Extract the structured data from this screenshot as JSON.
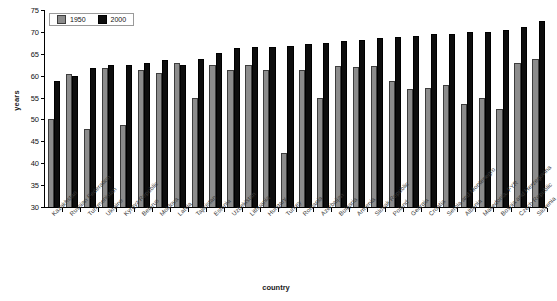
{
  "chart_data": {
    "type": "bar",
    "title": "",
    "xlabel": "country",
    "ylabel": "years",
    "ylim": [
      30,
      75
    ],
    "yticks": [
      30,
      35,
      40,
      45,
      50,
      55,
      60,
      65,
      70,
      75
    ],
    "grid": false,
    "legend_position": "top-left",
    "categories": [
      "Kazakhstan",
      "Russian Federation",
      "Turkmenistan",
      "Ukraine",
      "Kyrgyz Republic",
      "Belarus",
      "Moldova",
      "Latvia",
      "Tajikistan",
      "Estonia",
      "Uzbekistan",
      "Lithuania",
      "Hungary",
      "Turkey",
      "Romania",
      "Azerbaijan",
      "Bulgaria",
      "Armenia",
      "Slovak Republic",
      "Poland",
      "Georgia",
      "Croatia",
      "Serbia and Montenegro",
      "Albania",
      "Macedonia, FYR",
      "Bosnia and Herzegovina",
      "Czech Republic",
      "Slovenia"
    ],
    "series": [
      {
        "name": "1950",
        "color": "#8c8c8c",
        "values": [
          50.0,
          60.3,
          47.8,
          61.8,
          48.8,
          61.3,
          60.5,
          62.8,
          54.8,
          62.5,
          61.2,
          62.5,
          61.3,
          42.3,
          61.2,
          54.8,
          62.3,
          62.0,
          62.3,
          58.8,
          57.0,
          57.2,
          57.8,
          53.5,
          54.8,
          52.5,
          63.0,
          63.8
        ]
      },
      {
        "name": "2000",
        "color": "#0d0d0d",
        "values": [
          58.8,
          60.0,
          61.8,
          62.5,
          62.5,
          63.0,
          63.5,
          62.5,
          63.8,
          65.2,
          66.3,
          66.5,
          66.5,
          66.8,
          67.3,
          67.5,
          68.0,
          68.2,
          68.5,
          68.8,
          69.0,
          69.5,
          69.5,
          70.0,
          70.0,
          70.5,
          71.2,
          72.5
        ]
      }
    ]
  },
  "legend": {
    "items": [
      {
        "label": "1950"
      },
      {
        "label": "2000"
      }
    ]
  }
}
